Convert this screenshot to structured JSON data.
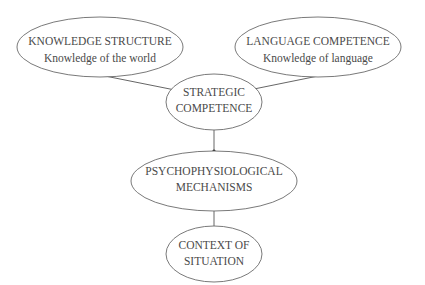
{
  "diagram": {
    "nodes": [
      {
        "id": "knowledge",
        "lines": [
          "KNOWLEDGE STRUCTURE",
          "Knowledge of the world"
        ]
      },
      {
        "id": "language",
        "lines": [
          "LANGUAGE COMPETENCE",
          "Knowledge of language"
        ]
      },
      {
        "id": "strategic",
        "lines": [
          "STRATEGIC",
          "COMPETENCE"
        ]
      },
      {
        "id": "psycho",
        "lines": [
          "PSYCHOPHYSIOLOGICAL",
          "MECHANISMS"
        ]
      },
      {
        "id": "context",
        "lines": [
          "CONTEXT OF",
          "SITUATION"
        ]
      }
    ],
    "edges": [
      {
        "from": "knowledge",
        "to": "strategic",
        "direction": "to"
      },
      {
        "from": "language",
        "to": "strategic",
        "direction": "to"
      },
      {
        "from": "strategic",
        "to": "psycho",
        "direction": "both"
      },
      {
        "from": "psycho",
        "to": "context",
        "direction": "both"
      }
    ]
  }
}
